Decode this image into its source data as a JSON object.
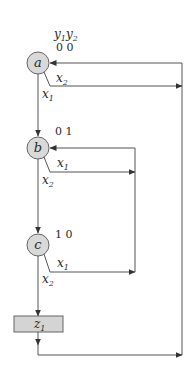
{
  "diagram": {
    "type": "ASM chart / state machine",
    "output_header": {
      "y1": "y",
      "y1_sub": "1",
      "y2": "y",
      "y2_sub": "2"
    },
    "states": [
      {
        "id": "a",
        "label": "a",
        "code": "0 0"
      },
      {
        "id": "b",
        "label": "b",
        "code": "0 1"
      },
      {
        "id": "c",
        "label": "c",
        "code": "1 0"
      }
    ],
    "output_box": {
      "label": "z",
      "sub": "1"
    },
    "transitions": [
      {
        "from": "a",
        "cond": "x",
        "cond_sub": "1",
        "to": "b"
      },
      {
        "from": "a",
        "cond": "x",
        "cond_sub": "2",
        "to": "a"
      },
      {
        "from": "b",
        "cond": "x",
        "cond_sub": "1",
        "to": "b"
      },
      {
        "from": "b",
        "cond": "x",
        "cond_sub": "2",
        "to": "c"
      },
      {
        "from": "c",
        "cond": "x",
        "cond_sub": "1",
        "to": "b"
      },
      {
        "from": "c",
        "cond": "x",
        "cond_sub": "2",
        "to": "z1"
      },
      {
        "from": "z1",
        "cond": "",
        "cond_sub": "",
        "to": "a"
      }
    ],
    "colors": {
      "node_fill": "#d9d9d9",
      "line": "#555555",
      "box_fill": "#d4d4d4"
    }
  }
}
